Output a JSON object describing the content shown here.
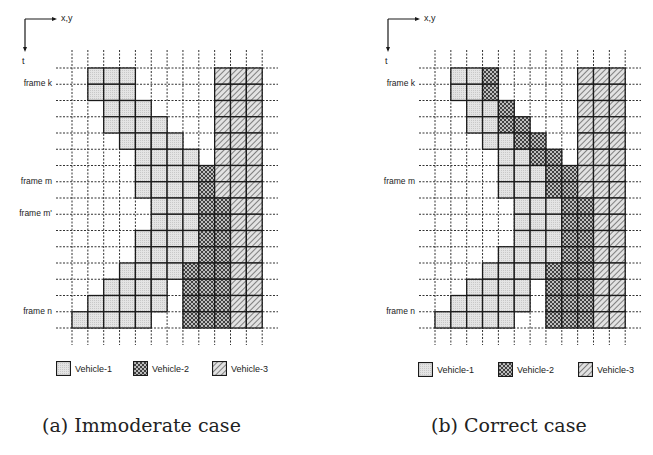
{
  "figures": [
    {
      "id": "a",
      "caption": "(a) Immoderate case",
      "axis": {
        "horizontal_label": "x,y",
        "vertical_label": "t"
      },
      "frame_labels": [
        {
          "label": "frame k",
          "row_line": 1
        },
        {
          "label": "frame m",
          "row_line": 7
        },
        {
          "label": "frame m'",
          "row_line": 9
        },
        {
          "label": "frame n",
          "row_line": 15
        }
      ],
      "rows": [
        {
          "v1": [
            1,
            3
          ],
          "v2": null,
          "v3": [
            9,
            11
          ]
        },
        {
          "v1": [
            1,
            3
          ],
          "v2": null,
          "v3": [
            9,
            11
          ]
        },
        {
          "v1": [
            2,
            4
          ],
          "v2": null,
          "v3": [
            9,
            11
          ]
        },
        {
          "v1": [
            2,
            5
          ],
          "v2": null,
          "v3": [
            9,
            11
          ]
        },
        {
          "v1": [
            3,
            6
          ],
          "v2": null,
          "v3": [
            9,
            11
          ]
        },
        {
          "v1": [
            4,
            7
          ],
          "v2": null,
          "v3": [
            9,
            11
          ]
        },
        {
          "v1": [
            4,
            7
          ],
          "v2": [
            8,
            8
          ],
          "v3": [
            9,
            11
          ]
        },
        {
          "v1": [
            4,
            7
          ],
          "v2": [
            8,
            8
          ],
          "v3": [
            9,
            11
          ]
        },
        {
          "v1": [
            5,
            7
          ],
          "v2": [
            8,
            9
          ],
          "v3": [
            10,
            11
          ]
        },
        {
          "v1": [
            5,
            7
          ],
          "v2": [
            8,
            9
          ],
          "v3": [
            10,
            11
          ]
        },
        {
          "v1": [
            4,
            7
          ],
          "v2": [
            8,
            9
          ],
          "v3": [
            10,
            11
          ]
        },
        {
          "v1": [
            4,
            7
          ],
          "v2": [
            8,
            9
          ],
          "v3": [
            10,
            11
          ]
        },
        {
          "v1": [
            3,
            6
          ],
          "v2": [
            7,
            9
          ],
          "v3": [
            10,
            11
          ]
        },
        {
          "v1": [
            2,
            5
          ],
          "v2": [
            7,
            9
          ],
          "v3": [
            10,
            11
          ]
        },
        {
          "v1": [
            1,
            5
          ],
          "v2": [
            7,
            9
          ],
          "v3": [
            10,
            11
          ]
        },
        {
          "v1": [
            0,
            4
          ],
          "v2": [
            7,
            9
          ],
          "v3": [
            10,
            11
          ]
        }
      ]
    },
    {
      "id": "b",
      "caption": "(b) Correct case",
      "axis": {
        "horizontal_label": "x,y",
        "vertical_label": "t"
      },
      "frame_labels": [
        {
          "label": "frame k",
          "row_line": 1
        },
        {
          "label": "frame m",
          "row_line": 7
        },
        {
          "label": "frame n",
          "row_line": 15
        }
      ],
      "rows": [
        {
          "v1": [
            1,
            2
          ],
          "v2": [
            3,
            3
          ],
          "v3": [
            9,
            11
          ]
        },
        {
          "v1": [
            1,
            2
          ],
          "v2": [
            3,
            3
          ],
          "v3": [
            9,
            11
          ]
        },
        {
          "v1": [
            2,
            3
          ],
          "v2": [
            4,
            4
          ],
          "v3": [
            9,
            11
          ]
        },
        {
          "v1": [
            2,
            3
          ],
          "v2": [
            4,
            5
          ],
          "v3": [
            9,
            11
          ]
        },
        {
          "v1": [
            3,
            4
          ],
          "v2": [
            5,
            6
          ],
          "v3": [
            9,
            11
          ]
        },
        {
          "v1": [
            4,
            5
          ],
          "v2": [
            6,
            7
          ],
          "v3": [
            9,
            11
          ]
        },
        {
          "v1": [
            4,
            6
          ],
          "v2": [
            7,
            8
          ],
          "v3": [
            9,
            11
          ]
        },
        {
          "v1": [
            4,
            6
          ],
          "v2": [
            7,
            8
          ],
          "v3": [
            9,
            11
          ]
        },
        {
          "v1": [
            5,
            7
          ],
          "v2": [
            8,
            9
          ],
          "v3": [
            10,
            11
          ]
        },
        {
          "v1": [
            5,
            7
          ],
          "v2": [
            8,
            9
          ],
          "v3": [
            10,
            11
          ]
        },
        {
          "v1": [
            5,
            7
          ],
          "v2": [
            8,
            9
          ],
          "v3": [
            10,
            11
          ]
        },
        {
          "v1": [
            4,
            7
          ],
          "v2": [
            8,
            9
          ],
          "v3": [
            10,
            11
          ]
        },
        {
          "v1": [
            3,
            6
          ],
          "v2": [
            7,
            9
          ],
          "v3": [
            10,
            11
          ]
        },
        {
          "v1": [
            2,
            5
          ],
          "v2": [
            7,
            9
          ],
          "v3": [
            10,
            11
          ]
        },
        {
          "v1": [
            1,
            5
          ],
          "v2": [
            7,
            9
          ],
          "v3": [
            10,
            11
          ]
        },
        {
          "v1": [
            0,
            4
          ],
          "v2": [
            7,
            9
          ],
          "v3": [
            10,
            11
          ]
        }
      ]
    }
  ],
  "legend": [
    {
      "key": "v1",
      "label": "Vehicle-1"
    },
    {
      "key": "v2",
      "label": "Vehicle-2"
    },
    {
      "key": "v3",
      "label": "Vehicle-3"
    }
  ],
  "colors": {
    "v1_fill": "#e4e4e4",
    "v2_fill": "#8a8a8a",
    "v3_fill": "#d6d6d6",
    "line": "#1a1a1a",
    "grid": "#333333"
  }
}
